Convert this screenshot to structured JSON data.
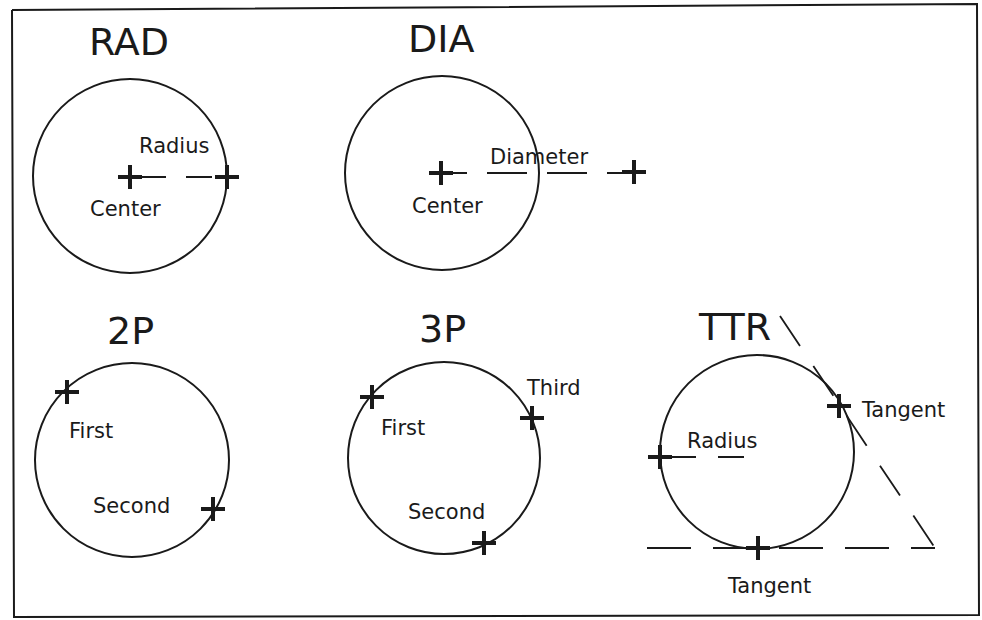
{
  "diagram": {
    "panels": [
      {
        "id": "rad",
        "title": "RAD",
        "labels": {
          "line": "Radius",
          "center": "Center"
        },
        "circle": {
          "cx": 130,
          "cy": 176,
          "r": 97
        },
        "points": [
          {
            "name": "Center",
            "x": 130,
            "y": 177
          },
          {
            "name": "Radius point",
            "x": 227,
            "y": 177
          }
        ]
      },
      {
        "id": "dia",
        "title": "DIA",
        "labels": {
          "line": "Diameter",
          "center": "Center"
        },
        "circle": {
          "cx": 442,
          "cy": 173,
          "r": 97
        },
        "points": [
          {
            "name": "Center",
            "x": 441,
            "y": 173
          },
          {
            "name": "Diameter point",
            "x": 634,
            "y": 172
          }
        ]
      },
      {
        "id": "2p",
        "title": "2P",
        "labels": {
          "first": "First",
          "second": "Second"
        },
        "circle": {
          "cx": 132,
          "cy": 460,
          "r": 97
        },
        "points": [
          {
            "name": "First",
            "x": 67,
            "y": 392
          },
          {
            "name": "Second",
            "x": 213,
            "y": 509
          }
        ]
      },
      {
        "id": "3p",
        "title": "3P",
        "labels": {
          "first": "First",
          "second": "Second",
          "third": "Third"
        },
        "circle": {
          "cx": 444,
          "cy": 458,
          "r": 96
        },
        "points": [
          {
            "name": "First",
            "x": 372,
            "y": 397
          },
          {
            "name": "Third",
            "x": 532,
            "y": 418
          },
          {
            "name": "Second",
            "x": 484,
            "y": 543
          }
        ]
      },
      {
        "id": "ttr",
        "title": "TTR",
        "labels": {
          "tangent_right": "Tangent",
          "tangent_bottom": "Tangent",
          "radius": "Radius"
        },
        "circle": {
          "cx": 757,
          "cy": 452,
          "r": 97
        },
        "points": [
          {
            "name": "Tangent",
            "x": 839,
            "y": 406
          },
          {
            "name": "Radius",
            "x": 660,
            "y": 457
          },
          {
            "name": "Tangent",
            "x": 758,
            "y": 548
          }
        ]
      }
    ]
  }
}
